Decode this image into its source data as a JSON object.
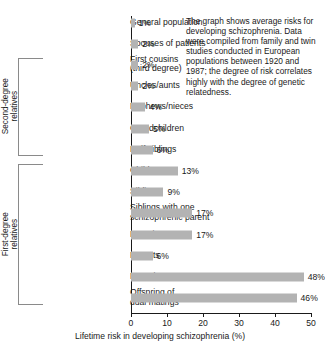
{
  "caption": {
    "text": "The graph shows average risks for developing schizophrenia. Data were compiled from family and twin studies conducted in European populations between 1920 and 1987; the degree of risk correlates highly with the degree of genetic relatedness."
  },
  "chart_data": {
    "type": "bar",
    "orientation": "horizontal",
    "title": "",
    "xlabel": "Lifetime risk in developing schizophrenia (%)",
    "ylabel": "",
    "xlim": [
      0,
      50
    ],
    "xticks": [
      "0",
      "10",
      "20",
      "30",
      "40",
      "50"
    ],
    "grid": false,
    "legend": null,
    "bar_color": "#b3b3b3",
    "categories": [
      "General population",
      "Spouses of patients",
      "First cousins (third degree)",
      "Uncles/aunts",
      "Nephews/nieces",
      "Grandchildren",
      "Half siblings",
      "Children",
      "Siblings",
      "Siblings with one schizophrenic parent",
      "DZ twins",
      "Parents",
      "MZ twins",
      "Offspring of dual matings"
    ],
    "values": [
      1,
      2,
      2,
      2,
      4,
      5,
      6,
      13,
      9,
      17,
      17,
      6,
      48,
      46
    ],
    "value_labels": [
      "1%",
      "2%",
      "2%",
      "2%",
      "4%",
      "5%",
      "6%",
      "13%",
      "9%",
      "17%",
      "17%",
      "6%",
      "48%",
      "46%"
    ],
    "rows": [
      {
        "label_lines": [
          "General population"
        ],
        "value": 1,
        "value_label": "1%"
      },
      {
        "label_lines": [
          "Spouses of patients"
        ],
        "value": 2,
        "value_label": "2%"
      },
      {
        "label_lines": [
          "First cousins",
          "(third degree)"
        ],
        "value": 2,
        "value_label": "2%"
      },
      {
        "label_lines": [
          "Uncles/aunts"
        ],
        "value": 2,
        "value_label": "2%"
      },
      {
        "label_lines": [
          "Nephews/nieces"
        ],
        "value": 4,
        "value_label": "4%"
      },
      {
        "label_lines": [
          "Grandchildren"
        ],
        "value": 5,
        "value_label": "5%"
      },
      {
        "label_lines": [
          "Half siblings"
        ],
        "value": 6,
        "value_label": "6%"
      },
      {
        "label_lines": [
          "Children"
        ],
        "value": 13,
        "value_label": "13%"
      },
      {
        "label_lines": [
          "Siblings"
        ],
        "value": 9,
        "value_label": "9%"
      },
      {
        "label_lines": [
          "Siblings with one",
          "schizophrenic parent"
        ],
        "value": 17,
        "value_label": "17%"
      },
      {
        "label_lines": [
          "DZ twins"
        ],
        "value": 17,
        "value_label": "17%"
      },
      {
        "label_lines": [
          "Parents"
        ],
        "value": 6,
        "value_label": "6%"
      },
      {
        "label_lines": [
          "MZ twins"
        ],
        "value": 48,
        "value_label": "48%"
      },
      {
        "label_lines": [
          "Offspring of",
          "dual matings"
        ],
        "value": 46,
        "value_label": "46%"
      }
    ],
    "groups": [
      {
        "name": "Second-degree relatives",
        "label_lines": [
          "Second-degree",
          "relatives"
        ],
        "first_row": 2,
        "last_row": 6
      },
      {
        "name": "First-degree relatives",
        "label_lines": [
          "First-degree",
          "relatives"
        ],
        "first_row": 7,
        "last_row": 13
      }
    ]
  }
}
